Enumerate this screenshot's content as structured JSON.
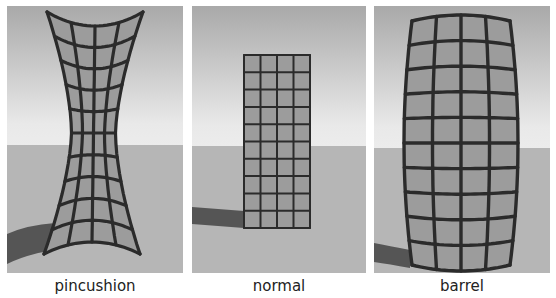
{
  "figure": {
    "colors": {
      "sky_top": "#a9a9a9",
      "sky_horizon": "#e8e8e8",
      "floor": "#b6b6b6",
      "shadow": "#555555",
      "grid_fill": "#9c9c9c",
      "grid_line": "#2b2b2b"
    },
    "grid": {
      "columns": 4,
      "rows": 10
    },
    "panels": [
      {
        "id": "pincushion",
        "label": "pincushion",
        "distortion": "pincushion",
        "x": 7,
        "width": 176
      },
      {
        "id": "normal",
        "label": "normal",
        "distortion": "none",
        "x": 192,
        "width": 174
      },
      {
        "id": "barrel",
        "label": "barrel",
        "distortion": "barrel",
        "x": 374,
        "width": 176
      }
    ]
  }
}
